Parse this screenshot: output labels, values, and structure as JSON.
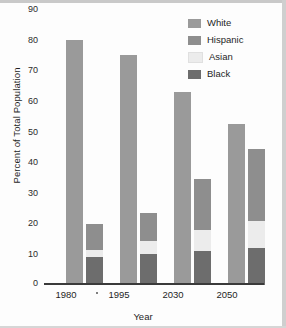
{
  "chart_data": {
    "type": "bar",
    "title": "",
    "xlabel": "Year",
    "ylabel": "Percent of Total Population",
    "categories": [
      "1980",
      "1995",
      "2030",
      "2050"
    ],
    "ylim": [
      0,
      90
    ],
    "yticks": [
      "90",
      "80",
      "70",
      "60",
      "50",
      "40",
      "30",
      "20",
      "10",
      "0"
    ],
    "grid": false,
    "legend_position": "top-right",
    "stacking": "White shown as separate bar; Black, Asian and Hispanic stacked in second bar",
    "series": [
      {
        "name": "White",
        "color": "#9a9a9a",
        "values": [
          80.0,
          75.0,
          63.0,
          52.5
        ]
      },
      {
        "name": "Hispanic",
        "color": "#8e8e8e",
        "values": [
          8.5,
          9.0,
          16.5,
          23.5
        ]
      },
      {
        "name": "Asian",
        "color": "#ececec",
        "values": [
          2.5,
          4.5,
          7.0,
          9.0
        ]
      },
      {
        "name": "Black",
        "color": "#6d6d6d",
        "values": [
          9.0,
          10.0,
          11.0,
          12.0
        ]
      }
    ],
    "stacked_totals": [
      20.5,
      23.5,
      34.5,
      44.5
    ]
  },
  "legend": {
    "items": [
      {
        "label": "White"
      },
      {
        "label": "Hispanic"
      },
      {
        "label": "Asian"
      },
      {
        "label": "Black"
      }
    ]
  },
  "axes": {
    "y_title": "Percent of Total Population",
    "x_title": "Year"
  }
}
